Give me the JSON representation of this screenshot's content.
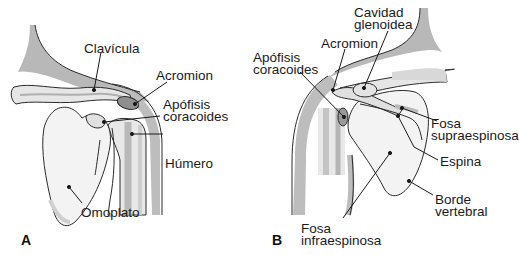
{
  "figure": {
    "panels": [
      {
        "id": "A",
        "letter": "A",
        "labels": {
          "clavicula": "Clavícula",
          "acromion": "Acromion",
          "apofisis_1": "Apófisis",
          "apofisis_2": "coracoides",
          "humero": "Húmero",
          "omoplato": "Omoplato"
        }
      },
      {
        "id": "B",
        "letter": "B",
        "labels": {
          "cavidad_1": "Cavidad",
          "cavidad_2": "glenoidea",
          "acromion": "Acromion",
          "apofisis_1": "Apófisis",
          "apofisis_2": "coracoides",
          "fosa_supra_1": "Fosa",
          "fosa_supra_2": "supraespinosa",
          "espina": "Espina",
          "borde_1": "Borde",
          "borde_2": "vertebral",
          "fosa_infra_1": "Fosa",
          "fosa_infra_2": "infraespinosa"
        }
      }
    ],
    "colors": {
      "bone_fill": "#f2f2f2",
      "shade_gray": "#b5b5b5",
      "dark_gray": "#8a8a8a",
      "outline": "#2a2a2a"
    }
  }
}
